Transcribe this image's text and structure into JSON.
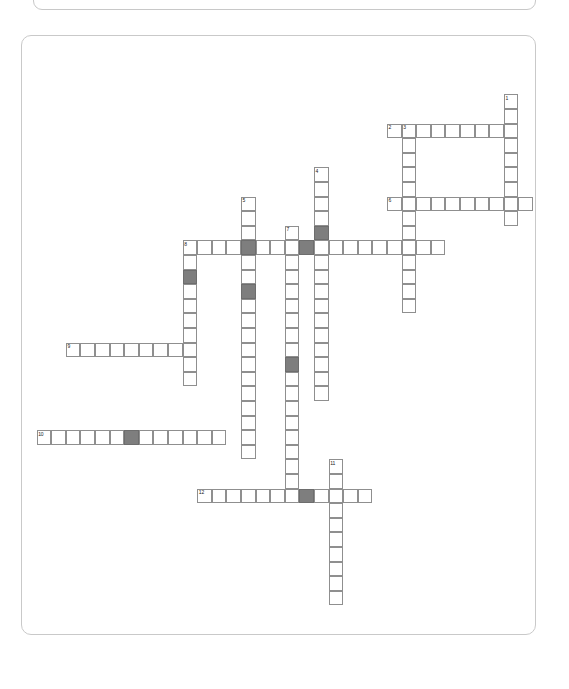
{
  "page": {
    "background_color": "#ffffff"
  },
  "top_card": {
    "name": "clipped-panel-above",
    "border_color": "#c8c8c8"
  },
  "puzzle": {
    "border_color": "#c9c9c9",
    "cell_border_color": "#8f8f8f",
    "cell_fill_color": "#ffffff",
    "shaded_fill_color": "#7e7e7e",
    "cell_size": 14.6,
    "origin_x": 0,
    "origin_y": 0,
    "clue_numbers": [
      "1",
      "2",
      "3",
      "4",
      "5",
      "6",
      "7",
      "8",
      "9",
      "10",
      "11",
      "12"
    ],
    "entries": [
      {
        "number": "1",
        "direction": "down",
        "col": 33,
        "row": 4,
        "length": 9,
        "label": "1"
      },
      {
        "number": "2",
        "direction": "across",
        "col": 25,
        "row": 6,
        "length": 8,
        "label": "2"
      },
      {
        "number": "3",
        "direction": "down",
        "col": 26,
        "row": 6,
        "length": 13,
        "label": "3"
      },
      {
        "number": "4",
        "direction": "down",
        "col": 20,
        "row": 9,
        "length": 16,
        "label": "4"
      },
      {
        "number": "5",
        "direction": "down",
        "col": 15,
        "row": 11,
        "length": 18,
        "label": "5"
      },
      {
        "number": "6",
        "direction": "across",
        "col": 25,
        "row": 11,
        "length": 10,
        "label": "6"
      },
      {
        "number": "7",
        "direction": "down",
        "col": 18,
        "row": 13,
        "length": 19,
        "label": "7"
      },
      {
        "number": "8",
        "direction": "across",
        "col": 11,
        "row": 14,
        "length": 18,
        "label": "8"
      },
      {
        "number": "8",
        "direction": "down",
        "col": 11,
        "row": 14,
        "length": 10,
        "label": "8"
      },
      {
        "number": "9",
        "direction": "across",
        "col": 3,
        "row": 21,
        "length": 9,
        "label": "9"
      },
      {
        "number": "10",
        "direction": "across",
        "col": 1,
        "row": 27,
        "length": 13,
        "label": "10"
      },
      {
        "number": "11",
        "direction": "down",
        "col": 21,
        "row": 29,
        "length": 10,
        "label": "11"
      },
      {
        "number": "12",
        "direction": "across",
        "col": 12,
        "row": 31,
        "length": 12,
        "label": "12"
      }
    ],
    "shaded_cells": [
      {
        "col": 20,
        "row": 13
      },
      {
        "col": 19,
        "row": 14
      },
      {
        "col": 15,
        "row": 14
      },
      {
        "col": 11,
        "row": 16
      },
      {
        "col": 15,
        "row": 17
      },
      {
        "col": 18,
        "row": 22
      },
      {
        "col": 7,
        "row": 27
      },
      {
        "col": 19,
        "row": 31
      }
    ]
  }
}
